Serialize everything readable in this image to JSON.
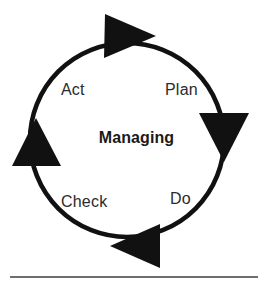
{
  "diagram": {
    "type": "pdca-cycle",
    "title": "Managing",
    "center_label": "Managing",
    "direction": "clockwise",
    "background_color": "#ffffff",
    "ring_color": "#111111",
    "label_color": "#2b2b2b",
    "center_label_color": "#1a1a1a",
    "rule_color": "#6e6e6e",
    "stages": [
      {
        "key": "plan",
        "label": "Plan",
        "position": "upper-right"
      },
      {
        "key": "do",
        "label": "Do",
        "position": "lower-right"
      },
      {
        "key": "check",
        "label": "Check",
        "position": "lower-left"
      },
      {
        "key": "act",
        "label": "Act",
        "position": "upper-left"
      }
    ],
    "arrows": [
      {
        "key": "arrow-top",
        "position": "top",
        "points": "right"
      },
      {
        "key": "arrow-right",
        "position": "right",
        "points": "down"
      },
      {
        "key": "arrow-bottom",
        "position": "bottom",
        "points": "left"
      },
      {
        "key": "arrow-left",
        "position": "left",
        "points": "up"
      }
    ],
    "rule": {
      "visible": true
    }
  }
}
